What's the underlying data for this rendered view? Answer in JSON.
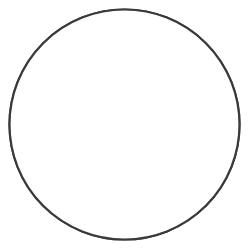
{
  "figure": {
    "background_color": "#ffffff",
    "width": 250,
    "height": 249
  },
  "boundary": {
    "shape_name": "circle",
    "center_x": 124.5,
    "center_y": 124.5,
    "radius": 115,
    "stroke_color": "#3a3a3a",
    "stroke_width": 2.2,
    "fill_color": "#ffffff"
  },
  "apex": {
    "x": 125,
    "y": 119,
    "label": "fold-hinge-apex"
  },
  "strokes": {
    "lightest": "#c9c9c9",
    "light": "#9a9a9a",
    "mid": "#6d6d6d",
    "dark": "#4a4a4a",
    "darkest": "#3a3a3a"
  },
  "chart_data": {
    "type": "line",
    "xlabel": "",
    "ylabel": "",
    "grid": false,
    "legend_position": "none",
    "xlim": [
      9,
      240
    ],
    "ylim": [
      9,
      240
    ],
    "series": [
      {
        "name": "left-band-1-outer",
        "stroke": "#c9c9c9",
        "stroke_width": 1.0,
        "path": "M 10 127 C 40 125, 78 124, 108 121 C 118 120, 122 119.4, 125 119 C 123 121, 118 124, 112 129 C 96 141, 84 152, 78 166 C 72 181, 70 205, 70 240"
      },
      {
        "name": "left-band-2",
        "stroke": "#9a9a9a",
        "stroke_width": 1.1,
        "path": "M 10 134 C 38 133, 74 131, 104 127 C 115 125, 121 123, 125 119 C 120 124, 110 132, 101 141 C 90 152, 83 164, 80 178 C 77 193, 78 214, 80 240"
      },
      {
        "name": "left-band-3",
        "stroke": "#6d6d6d",
        "stroke_width": 1.2,
        "path": "M 10 143 C 34 143, 58 142, 76 140 C 95 138, 110 134, 119 128 C 116 133, 108 140, 99 148 C 91 155, 87 164, 86 176 C 85 190, 87 214, 90 240"
      },
      {
        "name": "left-band-4-fold",
        "stroke": "#4a4a4a",
        "stroke_width": 1.3,
        "path": "M 10 157 C 26 157, 38 158, 48 161 C 56 163, 62 163, 68 160 C 76 156, 82 150, 90 148 C 96 147, 99 151, 97 157 C 95 163, 91 168, 90 176 C 89 187, 92 212, 96 240"
      },
      {
        "name": "left-band-5-inner",
        "stroke": "#4a4a4a",
        "stroke_width": 1.3,
        "path": "M 10 172 C 24 172, 34 174, 43 177 C 51 180, 58 180, 64 176 C 70 172, 74 168, 78 167"
      },
      {
        "name": "right-band-1-outer",
        "stroke": "#c9c9c9",
        "stroke_width": 1.0,
        "path": "M 240 110 C 212 111, 176 114, 148 117 C 136 118, 129 118.6, 125 119 C 128 121, 133 125, 140 131 C 155 143, 166 155, 172 169 C 178 184, 180 207, 180 240"
      },
      {
        "name": "right-band-2",
        "stroke": "#9a9a9a",
        "stroke_width": 1.1,
        "path": "M 240 119 C 214 119, 180 120, 152 123 C 139 124, 130 126, 125 119 C 130 125, 140 134, 149 143 C 160 154, 167 166, 170 180 C 173 195, 172 215, 170 240"
      },
      {
        "name": "right-band-3",
        "stroke": "#6d6d6d",
        "stroke_width": 1.2,
        "path": "M 240 129 C 216 128, 192 128, 174 130 C 155 132, 140 136, 131 142 C 134 147, 142 154, 151 162 C 159 169, 163 178, 164 190 C 165 204, 163 222, 160 240"
      },
      {
        "name": "right-band-4-fold",
        "stroke": "#4a4a4a",
        "stroke_width": 1.3,
        "path": "M 240 145 C 224 145, 212 146, 202 149 C 194 151, 188 151, 182 148 C 174 144, 168 138, 160 136 C 154 135, 151 139, 153 145 C 155 151, 159 156, 160 164 C 161 176, 158 210, 154 240"
      },
      {
        "name": "right-band-5-inner",
        "stroke": "#4a4a4a",
        "stroke_width": 1.3,
        "path": "M 240 160 C 226 160, 216 162, 207 165 C 199 168, 192 168, 186 164 C 180 160, 176 156, 172 155"
      },
      {
        "name": "center-left-stem",
        "stroke": "#6d6d6d",
        "stroke_width": 1.2,
        "path": "M 125 119 C 121 125, 114 136, 109 148 C 103 162, 100 182, 100 205 C 100 220, 101 232, 102 240"
      },
      {
        "name": "center-right-stem",
        "stroke": "#9a9a9a",
        "stroke_width": 1.1,
        "path": "M 125 119 C 126 127, 126 140, 124 156 C 121 178, 116 208, 113 240"
      },
      {
        "name": "center-right-stem-2",
        "stroke": "#6d6d6d",
        "stroke_width": 1.2,
        "path": "M 131 142 C 134 154, 138 172, 141 192 C 143 210, 145 228, 146 240"
      },
      {
        "name": "left-tail-inner",
        "stroke": "#6d6d6d",
        "stroke_width": 1.2,
        "path": "M 97 157 C 94 168, 91 186, 90 204 C 89 220, 89 232, 89 240"
      }
    ]
  }
}
